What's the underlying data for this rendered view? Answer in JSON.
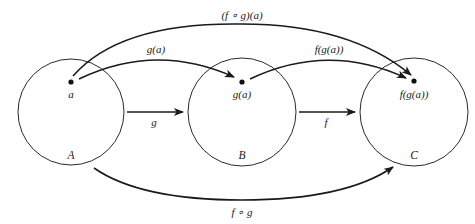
{
  "diagram": {
    "sets": [
      {
        "id": "A",
        "label": "A",
        "cx": 71,
        "cy": 112,
        "r": 53
      },
      {
        "id": "B",
        "label": "B",
        "cx": 242,
        "cy": 112,
        "r": 54
      },
      {
        "id": "C",
        "label": "C",
        "cx": 414,
        "cy": 112,
        "r": 54
      }
    ],
    "points": [
      {
        "id": "a",
        "label": "a",
        "x": 71,
        "y": 82
      },
      {
        "id": "ga",
        "label": "g(a)",
        "x": 242,
        "y": 82
      },
      {
        "id": "fga",
        "label": "f(g(a))",
        "x": 414,
        "y": 81
      }
    ],
    "arrows": {
      "g_map": {
        "label": "g",
        "from": "A",
        "to": "B"
      },
      "f_map": {
        "label": "f",
        "from": "B",
        "to": "C"
      },
      "a_to_ga": {
        "label": "g(a)",
        "from": "a",
        "to": "g(a)"
      },
      "ga_to_fga": {
        "label": "f(g(a))",
        "from": "g(a)",
        "to": "f(g(a))"
      },
      "a_to_fga": {
        "label": "(f ∘ g)(a)",
        "from": "a",
        "to": "f(g(a))"
      },
      "composition": {
        "label": "f ∘ g",
        "from": "A",
        "to": "C"
      }
    },
    "colors": {
      "stroke": "#1a1a1a",
      "background": "#ffffff"
    }
  }
}
